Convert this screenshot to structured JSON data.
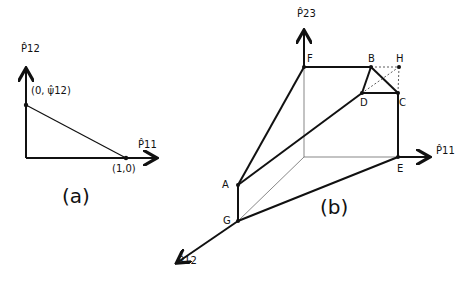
{
  "panel_a": {
    "caption": "(a)",
    "y_axis_label": "P̂12",
    "x_axis_label": "P̂11",
    "point_top_label": "(0, ψ̂12)",
    "point_right_label": "(1,0)"
  },
  "panel_b": {
    "caption": "(b)",
    "axis_vertical_label": "P̂23",
    "axis_right_label": "P̂11",
    "axis_diag_label": "P̂12",
    "vertices": [
      "F",
      "B",
      "H",
      "D",
      "C",
      "E",
      "A",
      "G"
    ]
  }
}
